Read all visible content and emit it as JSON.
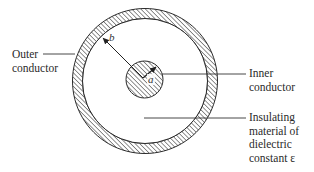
{
  "diagram": {
    "type": "coaxial-cable-cross-section",
    "colors": {
      "background": "#ffffff",
      "stroke": "#2a2a2a",
      "hatch": "#3a3a3a"
    },
    "dimensions": {
      "inner_radius_label": "a",
      "outer_radius_label": "b"
    },
    "labels": {
      "outer_conductor": {
        "line1": "Outer",
        "line2": "conductor"
      },
      "inner_conductor": {
        "line1": "Inner",
        "line2": "conductor"
      },
      "insulating": {
        "line1": "Insulating",
        "line2": "material of",
        "line3": "dielectric",
        "line4": "constant ε"
      }
    }
  }
}
